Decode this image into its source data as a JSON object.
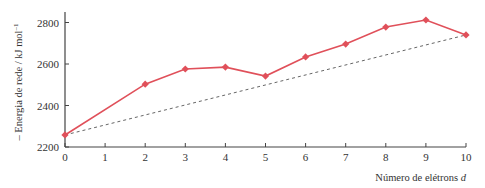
{
  "chart_data": {
    "type": "line",
    "title": "",
    "xlabel": "Número de elétrons d",
    "xlabel_text": "Número de elétrons ",
    "xlabel_italic": "d",
    "ylabel": "– Energia de rede / kJ mol⁻¹",
    "ylabel_text": "– Energia de rede / kJ mol",
    "ylabel_sup": "–1",
    "x": [
      0,
      2,
      3,
      4,
      5,
      6,
      7,
      8,
      9,
      10
    ],
    "series": [
      {
        "name": "Energia de rede",
        "color": "#e0505a",
        "marker": "diamond",
        "values": [
          2258,
          2503,
          2576,
          2585,
          2542,
          2634,
          2696,
          2778,
          2812,
          2740
        ]
      },
      {
        "name": "Linha de referência",
        "color": "#666666",
        "style": "dashed",
        "x": [
          0,
          10
        ],
        "values": [
          2258,
          2740
        ]
      }
    ],
    "xticks": [
      "0",
      "1",
      "2",
      "3",
      "4",
      "5",
      "6",
      "7",
      "8",
      "9",
      "10"
    ],
    "yticks": [
      "2200",
      "2400",
      "2600",
      "2800"
    ],
    "xlim": [
      0,
      10
    ],
    "ylim": [
      2200,
      2850
    ],
    "grid": false,
    "legend": "none"
  }
}
